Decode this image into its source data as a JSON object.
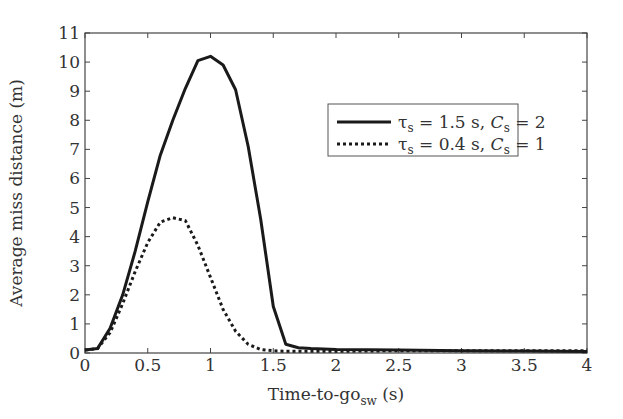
{
  "chart_data": {
    "type": "line",
    "title": "",
    "xlabel": "Time-to-go",
    "xlabel_subscript": "sw",
    "xlabel_unit": " (s)",
    "ylabel": "Average miss distance (m)",
    "xlim": [
      0,
      4
    ],
    "ylim": [
      0,
      11
    ],
    "x_ticks": [
      0,
      0.5,
      1,
      1.5,
      2,
      2.5,
      3,
      3.5,
      4
    ],
    "x_tick_labels": [
      "0",
      "0.5",
      "1",
      "1.5",
      "2",
      "2.5",
      "3",
      "3.5",
      "4"
    ],
    "y_ticks": [
      0,
      1,
      2,
      3,
      4,
      5,
      6,
      7,
      8,
      9,
      10,
      11
    ],
    "y_tick_labels": [
      "0",
      "1",
      "2",
      "3",
      "4",
      "5",
      "6",
      "7",
      "8",
      "9",
      "10",
      "11"
    ],
    "grid": false,
    "legend_position": "upper right",
    "series": [
      {
        "name": "τs = 1.5 s, Cs = 2",
        "label_parts": {
          "tau": "τ",
          "tau_sub": "s",
          "tau_val": " = 1.5 s, ",
          "c": "C",
          "c_sub": "s",
          "c_val": " = 2"
        },
        "style": "solid",
        "color": "#1a1a1a",
        "x": [
          0,
          0.1,
          0.2,
          0.3,
          0.4,
          0.5,
          0.6,
          0.7,
          0.8,
          0.9,
          1.0,
          1.1,
          1.2,
          1.3,
          1.4,
          1.5,
          1.6,
          1.7,
          1.8,
          2.0,
          2.5,
          3.0,
          3.5,
          4.0
        ],
        "y": [
          0.1,
          0.15,
          0.85,
          2.0,
          3.5,
          5.2,
          6.8,
          8.0,
          9.1,
          10.05,
          10.2,
          9.9,
          9.05,
          7.1,
          4.6,
          1.6,
          0.3,
          0.18,
          0.15,
          0.12,
          0.1,
          0.08,
          0.07,
          0.05
        ]
      },
      {
        "name": "τs = 0.4 s, Cs = 1",
        "label_parts": {
          "tau": "τ",
          "tau_sub": "s",
          "tau_val": " = 0.4 s, ",
          "c": "C",
          "c_sub": "s",
          "c_val": " = 1"
        },
        "style": "dotted",
        "color": "#1a1a1a",
        "x": [
          0,
          0.1,
          0.2,
          0.3,
          0.4,
          0.5,
          0.6,
          0.7,
          0.8,
          0.9,
          1.0,
          1.1,
          1.2,
          1.3,
          1.4,
          1.5,
          1.6,
          1.8,
          2.0,
          2.5,
          3.0,
          3.5,
          4.0
        ],
        "y": [
          0.1,
          0.15,
          0.7,
          1.7,
          2.8,
          3.8,
          4.5,
          4.65,
          4.55,
          3.7,
          2.6,
          1.5,
          0.75,
          0.3,
          0.12,
          0.08,
          0.06,
          0.06,
          0.06,
          0.08,
          0.08,
          0.08,
          0.08
        ]
      }
    ]
  }
}
